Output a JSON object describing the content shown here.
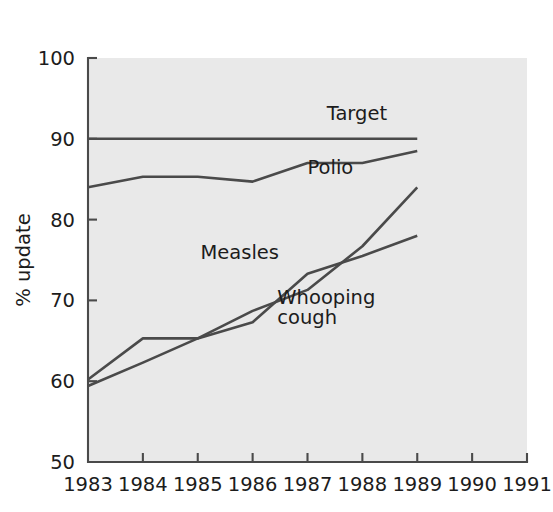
{
  "chart_data": {
    "type": "line",
    "title": "",
    "subtitle": "",
    "xlabel": "",
    "ylabel": "% update",
    "x": [
      1983,
      1984,
      1985,
      1986,
      1987,
      1988,
      1989,
      1990,
      1991
    ],
    "xtick_labels": [
      "1983",
      "1984",
      "1985",
      "1986",
      "1987",
      "1988",
      "1989",
      "1990",
      "1991"
    ],
    "ytick_labels": [
      "50",
      "60",
      "70",
      "80",
      "90",
      "100"
    ],
    "yticks": [
      50,
      60,
      70,
      80,
      90,
      100
    ],
    "xlim": [
      1983,
      1991
    ],
    "ylim": [
      50,
      100
    ],
    "grid": false,
    "legend_position": "inline-annotations",
    "series": [
      {
        "name": "Target",
        "label": "Target",
        "x": [
          1983,
          1989
        ],
        "values": [
          90,
          90
        ],
        "color": "#4a4a4a"
      },
      {
        "name": "Polio",
        "label": "Polio",
        "x": [
          1983,
          1984,
          1985,
          1986,
          1987,
          1988,
          1989
        ],
        "values": [
          84,
          85.3,
          85.3,
          84.7,
          87,
          87,
          88.5
        ],
        "color": "#4a4a4a"
      },
      {
        "name": "Measles",
        "label": "Measles",
        "x": [
          1983,
          1984,
          1985,
          1986,
          1987,
          1988,
          1989
        ],
        "values": [
          59.4,
          62.3,
          65.3,
          67.3,
          73.3,
          75.5,
          78
        ],
        "color": "#4a4a4a"
      },
      {
        "name": "Whooping cough",
        "label": "Whooping cough",
        "label_line1": "Whooping",
        "label_line2": "cough",
        "x": [
          1983,
          1984,
          1985,
          1986,
          1987,
          1988,
          1989
        ],
        "values": [
          60.2,
          65.3,
          65.3,
          68.7,
          71.3,
          76.7,
          84
        ],
        "color": "#4a4a4a"
      }
    ],
    "annotations": [
      {
        "text": "Target",
        "x": 1987.35,
        "y": 92.3
      },
      {
        "text": "Polio",
        "x": 1987.0,
        "y": 85.6
      },
      {
        "text": "Measles",
        "x": 1985.05,
        "y": 75.1
      },
      {
        "text": "Whooping",
        "x": 1986.45,
        "y": 69.6
      },
      {
        "text": "cough",
        "x": 1986.45,
        "y": 67.1
      }
    ],
    "colors": {
      "plot_background": "#e9e9e9",
      "page_background": "#ffffff",
      "line": "#4a4a4a",
      "axis": "#4a4a4a",
      "text": "#1c1c1c"
    }
  }
}
